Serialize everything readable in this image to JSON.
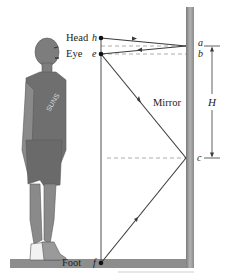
{
  "figure": {
    "labels": {
      "head": "Head",
      "eye": "Eye",
      "foot": "Foot",
      "mirror": "Mirror",
      "height": "H"
    },
    "points": {
      "h": "h",
      "e": "e",
      "f": "f",
      "a": "a",
      "b": "b",
      "c": "c"
    },
    "colors": {
      "ray": "#3a3a3a",
      "mirror": "#9a9a9a",
      "floor": "#8d8d8d",
      "person": "#7d7d7d",
      "dashed": "#8a8a8a"
    }
  }
}
